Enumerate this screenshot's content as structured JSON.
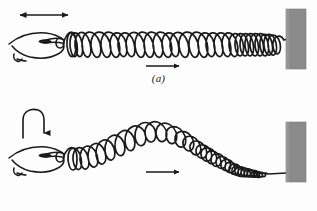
{
  "figure": {
    "background_color": "#fdfdfd",
    "ink_color": "#1a1a1a",
    "wall_color": "#8a8a8a",
    "wall_edge_color": "#6f6f6f",
    "width": 317,
    "height": 211
  },
  "panels": [
    {
      "id": "a",
      "label": "(a)",
      "wave_type": "longitudinal",
      "hand_motion_arrow": {
        "name": "double-headed-horizontal-arrow",
        "direction": "left-right",
        "x1": 18,
        "x2": 70,
        "y": 15
      },
      "propagation_arrow": {
        "name": "propagation-arrow",
        "direction": "right",
        "x1": 145,
        "x2": 181,
        "y": 66
      },
      "hand": {
        "name": "hand-gripping-spring",
        "x": 8,
        "y": 34
      },
      "spring": {
        "name": "longitudinal-spring",
        "start_x": 62,
        "end_x": 285,
        "axis_y": 45,
        "coils": 22,
        "loop_height": 30,
        "compression_pattern": "alternating compressions and rarefactions"
      },
      "wall": {
        "name": "wall-block",
        "x": 286,
        "y": 9,
        "width": 20,
        "height": 60
      }
    },
    {
      "id": "b",
      "label": "(b)",
      "wave_type": "transverse",
      "hand_motion_arrow": {
        "name": "curved-down-arrow",
        "direction": "up-over-down",
        "x": 22,
        "y": 8,
        "width": 22,
        "height": 30
      },
      "propagation_arrow": {
        "name": "propagation-arrow",
        "direction": "right",
        "x1": 145,
        "x2": 181,
        "y": 72
      },
      "hand": {
        "name": "hand-gripping-spring",
        "x": 8,
        "y": 48
      },
      "spring": {
        "name": "transverse-spring",
        "start_x": 62,
        "end_x": 285,
        "axis_y": 62,
        "coils": 24,
        "loop_height": 26,
        "wave_amplitude": 30,
        "wave_shape": "single crest hump near center, descending to wall"
      },
      "wall": {
        "name": "wall-block",
        "x": 286,
        "y": 22,
        "width": 20,
        "height": 60
      }
    }
  ]
}
